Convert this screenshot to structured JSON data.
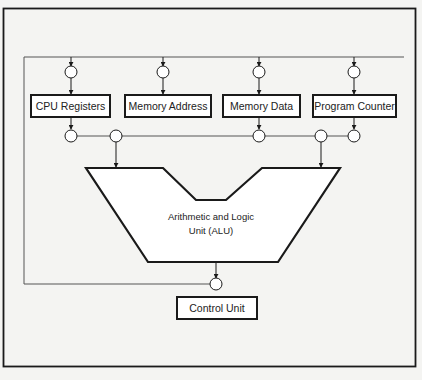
{
  "diagram": {
    "boxes": {
      "cpu_registers": "CPU Registers",
      "memory_address": "Memory Address",
      "memory_data": "Memory Data",
      "program_counter": "Program Counter",
      "control_unit": "Control Unit"
    },
    "alu": {
      "line1": "Arithmetic and Logic",
      "line2": "Unit (ALU)"
    },
    "colors": {
      "background": "#f4f4f2",
      "stroke": "#1a1a1a",
      "bus": "#555555"
    }
  }
}
